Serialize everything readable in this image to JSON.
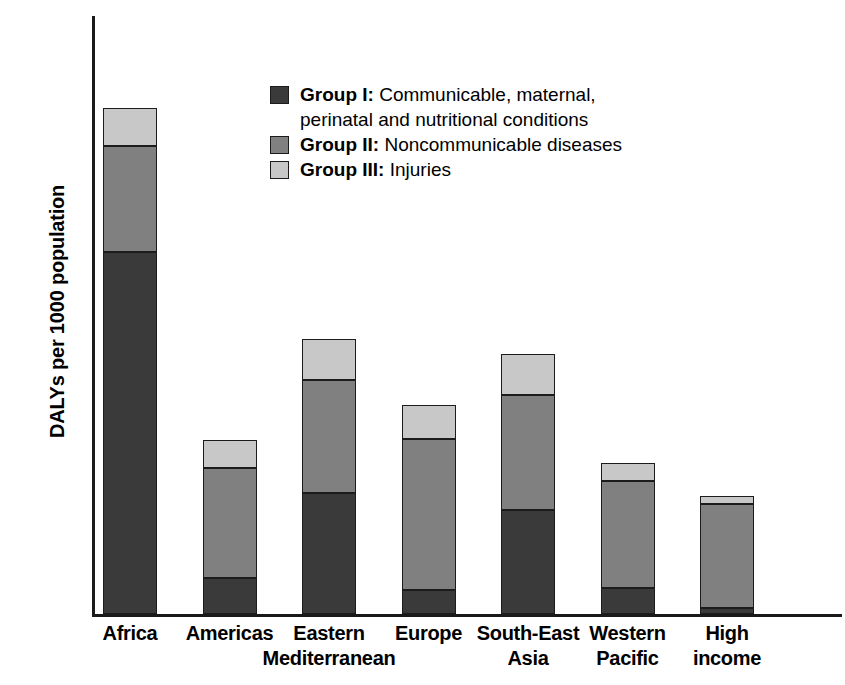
{
  "chart_data": {
    "type": "bar",
    "subtype": "stacked-bar",
    "title": "",
    "xlabel": "",
    "ylabel": "DALYs per 1000 population",
    "ylim": [
      0,
      600
    ],
    "yticks": [
      0,
      100,
      200,
      300,
      400,
      500,
      600
    ],
    "ytick_labels": [
      "0",
      "100",
      "200",
      "300",
      "400",
      "500",
      "600"
    ],
    "grid": false,
    "legend_position": "upper-center",
    "categories": [
      "Africa",
      "Americas",
      "Eastern Mediterranean",
      "Europe",
      "South-East Asia",
      "Western Pacific",
      "High income"
    ],
    "category_lines": [
      [
        "Africa",
        ""
      ],
      [
        "Americas",
        ""
      ],
      [
        "Eastern",
        "Mediterranean"
      ],
      [
        "Europe",
        ""
      ],
      [
        "South-East",
        "Asia"
      ],
      [
        "Western",
        "Pacific"
      ],
      [
        "High",
        "income"
      ]
    ],
    "series": [
      {
        "name": "Group I",
        "label": "Group I:",
        "description": "Communicable, maternal,",
        "description_line2": "perinatal and nutritional conditions",
        "color": "#3a3a3a",
        "values": [
          363,
          36,
          121,
          24,
          104,
          26,
          6
        ]
      },
      {
        "name": "Group II",
        "label": "Group II:",
        "description": "Noncommunicable diseases",
        "description_line2": "",
        "color": "#808080",
        "values": [
          107,
          111,
          114,
          152,
          116,
          107,
          104
        ]
      },
      {
        "name": "Group III",
        "label": "Group III:",
        "description": "Injuries",
        "description_line2": "",
        "color": "#c8c8c8",
        "values": [
          38,
          28,
          41,
          34,
          41,
          19,
          8
        ]
      }
    ],
    "totals": [
      508,
      175,
      276,
      210,
      261,
      152,
      118
    ],
    "axis_color": "#1a1a1a",
    "bar_outline_color": "#1c1c1c",
    "background_color": "#ffffff"
  }
}
